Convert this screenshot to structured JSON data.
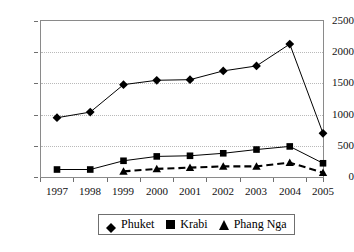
{
  "chart_data": {
    "type": "line",
    "title": "",
    "subtitle": "",
    "xlabel": "",
    "ylabel": "",
    "categories": [
      "1997",
      "1998",
      "1999",
      "2000",
      "2001",
      "2002",
      "2003",
      "2004",
      "2005"
    ],
    "x": [
      1997,
      1998,
      1999,
      2000,
      2001,
      2002,
      2003,
      2004,
      2005
    ],
    "ylim": [
      0,
      2500
    ],
    "yticks": [
      0,
      500,
      1000,
      1500,
      2000,
      2500
    ],
    "ytick_labels": [
      "0",
      "500",
      "1000",
      "1500",
      "2000",
      "2500"
    ],
    "grid": "horizontal-dotted",
    "legend_position": "bottom-center",
    "series": [
      {
        "name": "Phuket",
        "marker": "diamond",
        "line_style": "solid",
        "color": "#000000",
        "values": [
          950,
          1040,
          1480,
          1550,
          1560,
          1700,
          1780,
          2130,
          700
        ]
      },
      {
        "name": "Krabi",
        "marker": "square",
        "line_style": "solid",
        "color": "#000000",
        "values": [
          120,
          120,
          260,
          330,
          340,
          380,
          440,
          490,
          220
        ]
      },
      {
        "name": "Phang Nga",
        "marker": "triangle",
        "line_style": "dashed",
        "color": "#000000",
        "values": [
          null,
          null,
          90,
          130,
          150,
          170,
          170,
          230,
          70
        ]
      }
    ]
  },
  "legend": {
    "items": [
      {
        "label": "Phuket",
        "marker": "diamond-marker-icon"
      },
      {
        "label": "Krabi",
        "marker": "square-marker-icon"
      },
      {
        "label": "Phang Nga",
        "marker": "triangle-marker-icon"
      }
    ]
  }
}
